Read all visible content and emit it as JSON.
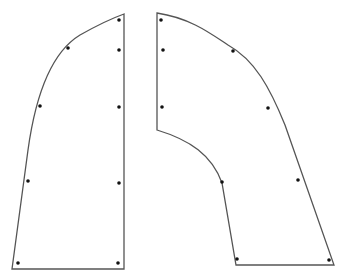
{
  "diagram": {
    "type": "pattern-pieces",
    "background": "#ffffff",
    "stroke_color": "#555555",
    "dot_color": "#111111",
    "pieces": [
      {
        "name": "left-panel",
        "path": "M124,14 L124,269 L12,269 L28,150 C36,92 52,52 80,35 C96,26 110,19 124,14 Z",
        "holes": [
          [
            119,
            20
          ],
          [
            68,
            48
          ],
          [
            119,
            50
          ],
          [
            40,
            106
          ],
          [
            119,
            107
          ],
          [
            28,
            181
          ],
          [
            119,
            183
          ],
          [
            18,
            263
          ],
          [
            118,
            263
          ]
        ]
      },
      {
        "name": "right-panel",
        "path": "M157,13 L157,130 C190,140 212,155 222,183 L236,265 L334,265 L285,125 C270,88 255,60 228,45 C210,33 190,18 157,13 Z",
        "holes": [
          [
            161,
            20
          ],
          [
            163,
            50
          ],
          [
            162,
            107
          ],
          [
            233,
            51
          ],
          [
            268,
            108
          ],
          [
            222,
            182
          ],
          [
            298,
            180
          ],
          [
            237,
            259
          ],
          [
            329,
            260
          ]
        ]
      }
    ]
  }
}
